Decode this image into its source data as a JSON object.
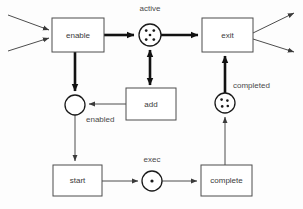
{
  "diagram": {
    "type": "petri-net",
    "transitions": [
      {
        "id": "enable",
        "label": "enable",
        "x": 52,
        "y": 18,
        "w": 52,
        "h": 34
      },
      {
        "id": "exit",
        "label": "exit",
        "x": 202,
        "y": 18,
        "w": 51,
        "h": 34
      },
      {
        "id": "add",
        "label": "add",
        "x": 126,
        "y": 88,
        "w": 50,
        "h": 32
      },
      {
        "id": "start",
        "label": "start",
        "x": 53,
        "y": 165,
        "w": 49,
        "h": 31
      },
      {
        "id": "complete",
        "label": "complete",
        "x": 201,
        "y": 165,
        "w": 51,
        "h": 31
      }
    ],
    "places": [
      {
        "id": "active",
        "label": "active",
        "cx": 150,
        "cy": 35,
        "r": 11,
        "tokens": 5,
        "label_x": 150,
        "label_y": 9
      },
      {
        "id": "enabled",
        "label": "enabled",
        "cx": 75,
        "cy": 105,
        "r": 10,
        "tokens": 0,
        "label_x": 97,
        "label_y": 120
      },
      {
        "id": "completed",
        "label": "completed",
        "cx": 225,
        "cy": 103,
        "r": 10,
        "tokens": 4,
        "label_x": 234,
        "label_y": 86
      },
      {
        "id": "exec",
        "label": "exec",
        "cx": 152,
        "cy": 182,
        "r": 10,
        "tokens": 1,
        "label_x": 152,
        "label_y": 160
      }
    ],
    "arcs": [
      {
        "id": "in-upper-to-enable",
        "from": "external",
        "to": "enable",
        "weight": "thin"
      },
      {
        "id": "in-lower-to-enable",
        "from": "external",
        "to": "enable",
        "weight": "thin"
      },
      {
        "id": "enable-to-active",
        "from": "enable",
        "to": "active",
        "weight": "thick"
      },
      {
        "id": "active-to-exit",
        "from": "active",
        "to": "exit",
        "weight": "thick"
      },
      {
        "id": "enable-to-enabled",
        "from": "enable",
        "to": "enabled",
        "weight": "thick"
      },
      {
        "id": "active-add-bidirectional",
        "from": "active",
        "to": "add",
        "weight": "thick"
      },
      {
        "id": "add-to-enabled",
        "from": "add",
        "to": "enabled",
        "weight": "thin"
      },
      {
        "id": "enabled-to-start",
        "from": "enabled",
        "to": "start",
        "weight": "thin"
      },
      {
        "id": "start-to-exec",
        "from": "start",
        "to": "exec",
        "weight": "thin"
      },
      {
        "id": "exec-to-complete",
        "from": "exec",
        "to": "complete",
        "weight": "thin"
      },
      {
        "id": "complete-to-completed",
        "from": "complete",
        "to": "completed",
        "weight": "thin"
      },
      {
        "id": "completed-to-exit",
        "from": "completed",
        "to": "exit",
        "weight": "thick"
      },
      {
        "id": "exit-out-upper",
        "from": "exit",
        "to": "external",
        "weight": "thin"
      },
      {
        "id": "exit-out-lower",
        "from": "exit",
        "to": "external",
        "weight": "thin"
      }
    ],
    "colors": {
      "background": "#fdfdfd",
      "box_stroke": "#4d4d4d",
      "circle_stroke": "#1a1a1a",
      "token_fill": "#1a1a1a",
      "arc_thin": "#4d4d4d",
      "arc_thick": "#111111",
      "text": "#3a3a3a"
    }
  }
}
